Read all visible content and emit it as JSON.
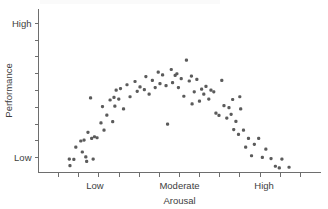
{
  "chart_data": {
    "type": "scatter",
    "title": "",
    "xlabel": "Arousal",
    "ylabel": "Performance",
    "x_tick_labels": [
      "Low",
      "Moderate",
      "High"
    ],
    "y_tick_labels": [
      "High",
      "Low"
    ],
    "xlim": [
      0,
      13
    ],
    "ylim": [
      0,
      10
    ],
    "grid": false,
    "legend": null,
    "x_minor_ticks": 13,
    "y_minor_ticks": 9,
    "marker_color": "#5b5b5b",
    "axis_color": "#6e6e6e",
    "background_color": "#ffffff",
    "points": [
      {
        "x": 1.42,
        "y": 0.82
      },
      {
        "x": 1.45,
        "y": 0.42
      },
      {
        "x": 1.63,
        "y": 0.8
      },
      {
        "x": 1.72,
        "y": 1.55
      },
      {
        "x": 1.95,
        "y": 1.92
      },
      {
        "x": 2.02,
        "y": 1.25
      },
      {
        "x": 2.1,
        "y": 1.98
      },
      {
        "x": 2.18,
        "y": 0.95
      },
      {
        "x": 2.22,
        "y": 0.68
      },
      {
        "x": 2.28,
        "y": 2.45
      },
      {
        "x": 2.4,
        "y": 4.55
      },
      {
        "x": 2.45,
        "y": 2.08
      },
      {
        "x": 2.52,
        "y": 0.82
      },
      {
        "x": 2.58,
        "y": 2.18
      },
      {
        "x": 2.7,
        "y": 2.12
      },
      {
        "x": 2.88,
        "y": 3.02
      },
      {
        "x": 2.95,
        "y": 4.02
      },
      {
        "x": 3.02,
        "y": 2.58
      },
      {
        "x": 3.15,
        "y": 3.5
      },
      {
        "x": 3.3,
        "y": 4.42
      },
      {
        "x": 3.42,
        "y": 3.1
      },
      {
        "x": 3.48,
        "y": 4.58
      },
      {
        "x": 3.52,
        "y": 4.05
      },
      {
        "x": 3.58,
        "y": 5.02
      },
      {
        "x": 3.7,
        "y": 4.48
      },
      {
        "x": 3.78,
        "y": 5.12
      },
      {
        "x": 3.92,
        "y": 3.88
      },
      {
        "x": 4.08,
        "y": 5.35
      },
      {
        "x": 4.22,
        "y": 4.62
      },
      {
        "x": 4.45,
        "y": 5.55
      },
      {
        "x": 4.55,
        "y": 4.95
      },
      {
        "x": 4.68,
        "y": 5.22
      },
      {
        "x": 4.88,
        "y": 5.05
      },
      {
        "x": 4.95,
        "y": 5.85
      },
      {
        "x": 5.1,
        "y": 4.78
      },
      {
        "x": 5.25,
        "y": 5.62
      },
      {
        "x": 5.38,
        "y": 5.18
      },
      {
        "x": 5.52,
        "y": 6.12
      },
      {
        "x": 5.6,
        "y": 5.42
      },
      {
        "x": 5.72,
        "y": 5.95
      },
      {
        "x": 5.88,
        "y": 5.3
      },
      {
        "x": 5.95,
        "y": 2.95
      },
      {
        "x": 6.12,
        "y": 6.28
      },
      {
        "x": 6.18,
        "y": 5.48
      },
      {
        "x": 6.3,
        "y": 5.92
      },
      {
        "x": 6.38,
        "y": 6.02
      },
      {
        "x": 6.45,
        "y": 5.18
      },
      {
        "x": 6.58,
        "y": 5.72
      },
      {
        "x": 6.7,
        "y": 4.65
      },
      {
        "x": 6.82,
        "y": 6.85
      },
      {
        "x": 6.95,
        "y": 5.58
      },
      {
        "x": 7.05,
        "y": 5.88
      },
      {
        "x": 7.18,
        "y": 4.92
      },
      {
        "x": 7.3,
        "y": 5.68
      },
      {
        "x": 7.42,
        "y": 4.35
      },
      {
        "x": 7.52,
        "y": 5.08
      },
      {
        "x": 7.62,
        "y": 4.78
      },
      {
        "x": 7.72,
        "y": 5.25
      },
      {
        "x": 7.85,
        "y": 4.48
      },
      {
        "x": 7.95,
        "y": 5.02
      },
      {
        "x": 8.08,
        "y": 4.92
      },
      {
        "x": 8.18,
        "y": 3.62
      },
      {
        "x": 8.32,
        "y": 3.48
      },
      {
        "x": 8.45,
        "y": 5.62
      },
      {
        "x": 8.55,
        "y": 4.08
      },
      {
        "x": 8.68,
        "y": 3.32
      },
      {
        "x": 8.78,
        "y": 3.95
      },
      {
        "x": 8.88,
        "y": 3.55
      },
      {
        "x": 9.0,
        "y": 2.62
      },
      {
        "x": 9.1,
        "y": 3.12
      },
      {
        "x": 9.22,
        "y": 2.32
      },
      {
        "x": 9.32,
        "y": 3.88
      },
      {
        "x": 9.45,
        "y": 2.58
      },
      {
        "x": 9.55,
        "y": 1.55
      },
      {
        "x": 9.68,
        "y": 2.08
      },
      {
        "x": 9.82,
        "y": 1.02
      },
      {
        "x": 9.95,
        "y": 1.72
      },
      {
        "x": 10.15,
        "y": 2.08
      },
      {
        "x": 10.32,
        "y": 0.92
      },
      {
        "x": 10.48,
        "y": 1.42
      },
      {
        "x": 10.72,
        "y": 0.85
      },
      {
        "x": 10.92,
        "y": 0.38
      },
      {
        "x": 11.1,
        "y": 0.28
      },
      {
        "x": 11.22,
        "y": 0.82
      },
      {
        "x": 11.55,
        "y": 0.32
      },
      {
        "x": 9.28,
        "y": 4.62
      },
      {
        "x": 8.95,
        "y": 4.45
      },
      {
        "x": 7.08,
        "y": 4.18
      }
    ]
  }
}
